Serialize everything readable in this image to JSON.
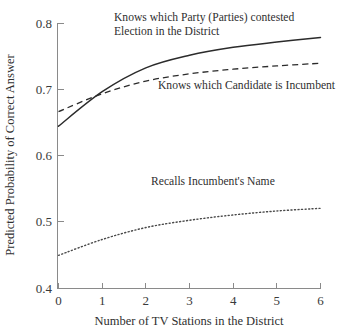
{
  "chart_data": {
    "type": "line",
    "title": "",
    "xlabel": "Number of TV Stations in the District",
    "ylabel": "Predicted Probability of Correct Answer",
    "xlim": [
      0,
      6
    ],
    "ylim": [
      0.4,
      0.8
    ],
    "xticks": [
      "0",
      "1",
      "2",
      "3",
      "4",
      "5",
      "6"
    ],
    "yticks": [
      "0.4",
      "0.5",
      "0.6",
      "0.7",
      "0.8"
    ],
    "grid": false,
    "legend_position": "inline-annotations",
    "x": [
      0,
      1,
      2,
      3,
      4,
      5,
      6
    ],
    "series": [
      {
        "name": "Knows which Party (Parties) contested Election in the District",
        "style": "solid",
        "values": [
          0.645,
          0.697,
          0.733,
          0.752,
          0.764,
          0.772,
          0.779
        ]
      },
      {
        "name": "Knows which Candidate is Incumbent",
        "style": "dashed",
        "values": [
          0.667,
          0.694,
          0.713,
          0.724,
          0.731,
          0.736,
          0.74
        ]
      },
      {
        "name": "Recalls Incumbent's Name",
        "style": "dotted",
        "values": [
          0.45,
          0.474,
          0.492,
          0.503,
          0.511,
          0.517,
          0.521
        ]
      }
    ],
    "annotations": [
      {
        "id": "party-label",
        "lines": [
          "Knows which Party (Parties) contested",
          "Election in the District"
        ]
      },
      {
        "id": "candidate-label",
        "lines": [
          "Knows which Candidate is Incumbent"
        ]
      },
      {
        "id": "recall-label",
        "lines": [
          "Recalls Incumbent's Name"
        ]
      }
    ],
    "colors": {
      "background": "#ffffff",
      "axis": "#8a8a8a",
      "solid_series": "#2b2b2b",
      "dashed_series": "#2b2b2b",
      "dotted_series": "#4a4a4a",
      "text": "#2f2f2f"
    }
  }
}
